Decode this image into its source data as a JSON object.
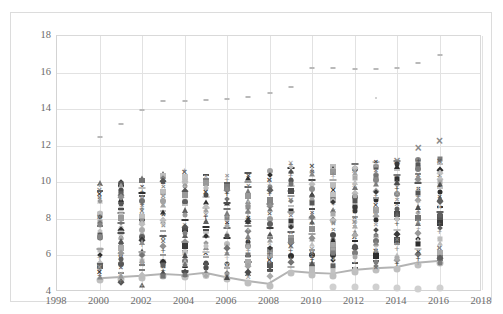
{
  "chart_data": {
    "type": "scatter",
    "title": "",
    "subtitle": "",
    "xlabel": "",
    "ylabel": "",
    "xlim": [
      1998,
      2018
    ],
    "ylim": [
      4,
      18
    ],
    "x_ticks": [
      1998,
      2000,
      2002,
      2004,
      2006,
      2008,
      2010,
      2012,
      2014,
      2016,
      2018
    ],
    "y_ticks": [
      4,
      6,
      8,
      10,
      12,
      14,
      16,
      18
    ],
    "grid": true,
    "legend": "none",
    "background": "#ffffff",
    "grid_color": "#e2e2e2",
    "axis_text_color": "#6b6b6b",
    "note": "Dense multi-series scatter: each year column stacks many grayscale markers (squares, circles, diamonds, X, plus, triangle) between roughly 4.2 and 12.3; a light-gray connected line with round markers tracks the lower envelope, and a sparse light-gray dash series sits high at 12.5-17.",
    "series": [
      {
        "name": "top-outlier-dash-series",
        "marker": "dash",
        "color": "#b9b9b9",
        "size": 4,
        "x": [
          2000,
          2001,
          2002,
          2003,
          2004,
          2005,
          2006,
          2007,
          2008,
          2009,
          2010,
          2011,
          2012,
          2013,
          2014,
          2015,
          2016
        ],
        "values": [
          12.5,
          13.2,
          13.95,
          14.45,
          14.45,
          14.5,
          14.55,
          14.65,
          14.9,
          15.2,
          16.25,
          16.25,
          16.2,
          16.2,
          16.25,
          16.5,
          16.95
        ]
      },
      {
        "name": "mid-outlier-dot-series",
        "marker": "dot",
        "color": "#c4c4c4",
        "size": 2,
        "x": [
          2013
        ],
        "values": [
          14.6
        ]
      },
      {
        "name": "lower-envelope-line-series",
        "marker": "circle",
        "marker_color": "#bfbfbf",
        "line_color": "#b3b3b3",
        "line_width": 2,
        "size": 7,
        "x": [
          2000,
          2001,
          2002,
          2003,
          2004,
          2005,
          2006,
          2007,
          2008,
          2009,
          2010,
          2011,
          2012,
          2013,
          2014,
          2015,
          2016
        ],
        "values": [
          4.65,
          4.72,
          4.78,
          4.88,
          4.82,
          4.95,
          4.7,
          4.5,
          4.35,
          5.05,
          4.95,
          4.9,
          5.1,
          5.2,
          5.25,
          5.5,
          5.6
        ]
      },
      {
        "name": "bottom-floor-circle-series",
        "marker": "circle",
        "color": "#d0d0d0",
        "size": 7,
        "x": [
          2011,
          2012,
          2013,
          2014,
          2015,
          2016
        ],
        "values": [
          4.25,
          4.25,
          4.25,
          4.2,
          4.18,
          4.22
        ]
      },
      {
        "name": "x-marker-high-series",
        "marker": "x",
        "color": "#8a8a8a",
        "size": 9,
        "x": [
          2014,
          2015,
          2016
        ],
        "values": [
          11.15,
          11.9,
          12.25
        ]
      },
      {
        "name": "cluster-2000",
        "marker": "mixed",
        "x": 2000,
        "values": [
          9.95,
          9.8,
          9.6,
          9.35,
          9.15,
          8.95,
          8.25,
          8.1,
          7.85,
          7.6,
          7.35,
          7.1,
          6.95,
          6.3,
          6.0,
          5.85,
          5.6,
          5.4,
          5.25,
          5.1,
          4.9
        ]
      },
      {
        "name": "cluster-2001",
        "marker": "mixed",
        "x": 2001,
        "values": [
          10.0,
          9.8,
          9.55,
          9.3,
          9.1,
          8.85,
          8.55,
          8.3,
          8.05,
          7.8,
          7.5,
          7.2,
          6.95,
          6.7,
          6.4,
          6.1,
          5.85,
          5.55,
          5.3,
          5.05,
          4.85,
          4.55
        ]
      },
      {
        "name": "cluster-2002",
        "marker": "mixed",
        "x": 2002,
        "values": [
          10.2,
          10.0,
          9.75,
          9.5,
          9.25,
          9.0,
          8.7,
          8.45,
          8.2,
          7.95,
          7.65,
          7.4,
          7.1,
          6.85,
          6.55,
          6.25,
          6.0,
          5.7,
          5.45,
          5.2,
          4.9,
          4.4
        ]
      },
      {
        "name": "cluster-2003",
        "marker": "mixed",
        "x": 2003,
        "values": [
          10.45,
          10.25,
          10.0,
          9.75,
          9.5,
          9.25,
          9.0,
          8.75,
          8.45,
          8.2,
          7.9,
          7.6,
          7.35,
          7.05,
          6.8,
          6.5,
          6.2,
          5.95,
          5.65,
          5.35,
          5.1,
          4.9
        ]
      },
      {
        "name": "cluster-2004",
        "marker": "mixed",
        "x": 2004,
        "values": [
          10.55,
          10.3,
          10.05,
          9.8,
          9.55,
          9.3,
          9.0,
          8.75,
          8.5,
          8.2,
          7.95,
          7.65,
          7.35,
          7.1,
          6.8,
          6.5,
          6.25,
          6.0,
          5.7,
          5.45,
          5.15,
          4.85
        ]
      },
      {
        "name": "cluster-2005",
        "marker": "mixed",
        "x": 2005,
        "values": [
          10.4,
          10.2,
          9.95,
          9.7,
          9.45,
          9.2,
          8.9,
          8.65,
          8.4,
          8.1,
          7.85,
          7.55,
          7.3,
          7.0,
          6.7,
          6.45,
          6.15,
          5.9,
          5.6,
          5.35,
          5.1,
          4.85
        ]
      },
      {
        "name": "cluster-2006",
        "marker": "mixed",
        "x": 2006,
        "values": [
          10.35,
          10.1,
          9.85,
          9.6,
          9.35,
          9.1,
          8.85,
          8.55,
          8.3,
          8.05,
          7.75,
          7.5,
          7.2,
          6.95,
          6.65,
          6.4,
          6.1,
          5.85,
          5.55,
          5.3,
          5.05,
          4.8
        ]
      },
      {
        "name": "cluster-2007",
        "marker": "mixed",
        "x": 2007,
        "values": [
          10.5,
          10.25,
          10.0,
          9.75,
          9.5,
          9.25,
          8.95,
          8.7,
          8.45,
          8.15,
          7.9,
          7.6,
          7.35,
          7.05,
          6.75,
          6.5,
          6.2,
          5.95,
          5.65,
          5.4,
          5.1,
          4.8
        ]
      },
      {
        "name": "cluster-2008",
        "marker": "mixed",
        "x": 2008,
        "values": [
          10.6,
          10.35,
          10.1,
          9.85,
          9.6,
          9.35,
          9.05,
          8.8,
          8.55,
          8.25,
          8.0,
          7.7,
          7.45,
          7.15,
          6.85,
          6.6,
          6.3,
          6.05,
          5.75,
          5.5,
          5.2,
          4.9
        ]
      },
      {
        "name": "cluster-2009",
        "marker": "mixed",
        "x": 2009,
        "values": [
          11.05,
          10.8,
          10.55,
          10.3,
          10.05,
          9.8,
          9.5,
          9.25,
          9.0,
          8.7,
          8.45,
          8.15,
          7.9,
          7.6,
          7.3,
          7.05,
          6.75,
          6.5,
          6.2,
          5.95,
          5.65,
          5.35
        ]
      },
      {
        "name": "cluster-2010",
        "marker": "mixed",
        "x": 2010,
        "values": [
          10.9,
          10.65,
          10.4,
          10.15,
          9.9,
          9.65,
          9.35,
          9.1,
          8.85,
          8.55,
          8.3,
          8.0,
          7.75,
          7.45,
          7.15,
          6.9,
          6.6,
          6.35,
          6.05,
          5.8,
          5.5,
          5.2
        ]
      },
      {
        "name": "cluster-2011",
        "marker": "mixed",
        "x": 2011,
        "values": [
          10.85,
          10.6,
          10.35,
          10.1,
          9.85,
          9.6,
          9.3,
          9.05,
          8.8,
          8.5,
          8.25,
          7.95,
          7.7,
          7.4,
          7.1,
          6.85,
          6.55,
          6.3,
          6.0,
          5.75,
          5.45,
          5.15
        ]
      },
      {
        "name": "cluster-2012",
        "marker": "mixed",
        "x": 2012,
        "values": [
          11.0,
          10.75,
          10.5,
          10.25,
          10.0,
          9.75,
          9.45,
          9.2,
          8.95,
          8.65,
          8.4,
          8.1,
          7.85,
          7.55,
          7.25,
          7.0,
          6.7,
          6.45,
          6.15,
          5.9,
          5.6,
          5.3
        ]
      },
      {
        "name": "cluster-2013",
        "marker": "mixed",
        "x": 2013,
        "values": [
          11.1,
          10.85,
          10.6,
          10.35,
          10.1,
          9.85,
          9.55,
          9.3,
          9.05,
          8.75,
          8.5,
          8.2,
          7.95,
          7.65,
          7.35,
          7.1,
          6.8,
          6.55,
          6.25,
          6.0,
          5.7,
          5.4
        ]
      },
      {
        "name": "cluster-2014",
        "marker": "mixed",
        "x": 2014,
        "values": [
          11.15,
          10.9,
          10.65,
          10.4,
          10.15,
          9.9,
          9.6,
          9.35,
          9.1,
          8.8,
          8.55,
          8.25,
          8.0,
          7.7,
          7.4,
          7.15,
          6.85,
          6.6,
          6.3,
          6.05,
          5.75,
          5.5
        ]
      },
      {
        "name": "cluster-2015",
        "marker": "mixed",
        "x": 2015,
        "values": [
          11.2,
          10.95,
          10.7,
          10.45,
          10.2,
          9.95,
          9.65,
          9.4,
          9.15,
          8.85,
          8.6,
          8.3,
          8.05,
          7.75,
          7.45,
          7.2,
          6.9,
          6.65,
          6.35,
          6.1,
          5.8,
          5.55
        ]
      },
      {
        "name": "cluster-2016",
        "marker": "mixed",
        "x": 2016,
        "values": [
          11.25,
          11.0,
          10.75,
          10.5,
          10.25,
          10.0,
          9.7,
          9.45,
          9.2,
          8.9,
          8.65,
          8.35,
          8.1,
          7.8,
          7.5,
          7.25,
          6.95,
          6.7,
          6.4,
          6.15,
          5.85,
          5.6
        ]
      }
    ]
  },
  "axes": {
    "y_tick_labels": [
      "18",
      "16",
      "14",
      "12",
      "10",
      "8",
      "6",
      "4"
    ],
    "x_tick_labels": [
      "1998",
      "2000",
      "2002",
      "2004",
      "2006",
      "2008",
      "2010",
      "2012",
      "2014",
      "2016",
      "2018"
    ]
  }
}
